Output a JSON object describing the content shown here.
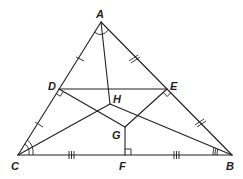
{
  "diagram": {
    "type": "triangle-geometry",
    "points": {
      "A": {
        "label": "A",
        "x": 101,
        "y": 22
      },
      "B": {
        "label": "B",
        "x": 232,
        "y": 155
      },
      "C": {
        "label": "C",
        "x": 18,
        "y": 155
      },
      "D": {
        "label": "D",
        "x": 59,
        "y": 89
      },
      "E": {
        "label": "E",
        "x": 167,
        "y": 89
      },
      "F": {
        "label": "F",
        "x": 125,
        "y": 155
      },
      "G": {
        "label": "G",
        "x": 125,
        "y": 127
      },
      "H": {
        "label": "H",
        "x": 110,
        "y": 104
      }
    },
    "segments": [
      [
        "A",
        "B"
      ],
      [
        "B",
        "C"
      ],
      [
        "C",
        "A"
      ],
      [
        "D",
        "E"
      ],
      [
        "A",
        "H"
      ],
      [
        "C",
        "H"
      ],
      [
        "B",
        "H"
      ],
      [
        "D",
        "G"
      ],
      [
        "E",
        "G"
      ],
      [
        "F",
        "G"
      ]
    ],
    "congruence_marks": {
      "AD_DC": "single tick",
      "AE_EB": "double tick",
      "CF_FB": "triple tick"
    },
    "angle_marks": {
      "A": "single arc (angle bisector AH)",
      "C": "double arc (angle bisector CH)",
      "B": "triple arc (angle bisector BH)"
    },
    "right_angles": [
      "D",
      "E",
      "F"
    ],
    "colors": {
      "stroke": "#231f20",
      "background": "#ffffff"
    }
  }
}
